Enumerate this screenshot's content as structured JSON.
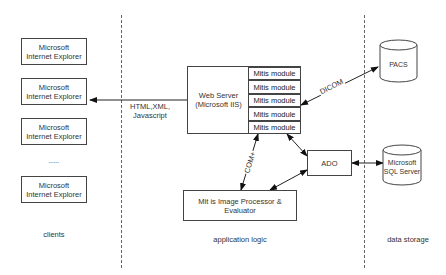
{
  "zones": {
    "clients": "clients",
    "application_logic": "application logic",
    "data_storage": "data storage"
  },
  "clients": {
    "boxes": [
      {
        "line1": "Microsoft",
        "line2": "Internet Explorer"
      },
      {
        "line1": "Microsoft",
        "line2": "Internet Explorer"
      },
      {
        "line1": "Microsoft",
        "line2": "Internet Explorer"
      },
      {
        "line1": "Microsoft",
        "line2": "Internet Explorer"
      }
    ],
    "ellipsis": "....."
  },
  "web_server": {
    "line1": "Web Server",
    "line2": "(Microsoft IIS)",
    "modules": [
      "Mitis module",
      "Mitis module",
      "Mitis module",
      "Mitis module",
      "Mitis module"
    ]
  },
  "processor": {
    "line1": "Mit is Image Processor &",
    "line2": "Evaluator"
  },
  "ado": {
    "label": "ADO"
  },
  "pacs": {
    "label": "PACS"
  },
  "sql": {
    "line1": "Microsoft",
    "line2": "SQL Server"
  },
  "edges": {
    "http": {
      "line1": "HTML,XML,",
      "line2": "Javascript"
    },
    "dicom": "DICOM",
    "com": "COM+"
  },
  "colors": {
    "line": "#222222",
    "dash": "#666666",
    "border": "#444444"
  }
}
